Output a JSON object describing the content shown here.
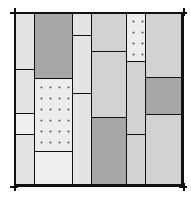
{
  "diagram": {
    "title": "",
    "colors": {
      "line": "#111111",
      "light": "#e4e4e4",
      "lighter": "#efefef",
      "mid": "#d2d2d2",
      "dark": "#a7a7a7",
      "stipple": "#ececec"
    },
    "tiles": [
      {
        "col": "A",
        "x": 14,
        "y": 12,
        "w": 20,
        "h": 57,
        "fill": "light"
      },
      {
        "col": "A",
        "x": 14,
        "y": 69,
        "w": 20,
        "h": 44,
        "fill": "light"
      },
      {
        "col": "A",
        "x": 14,
        "y": 113,
        "w": 20,
        "h": 21,
        "fill": "lighter"
      },
      {
        "col": "A",
        "x": 14,
        "y": 134,
        "w": 20,
        "h": 52,
        "fill": "light"
      },
      {
        "col": "B",
        "x": 34,
        "y": 12,
        "w": 38,
        "h": 66,
        "fill": "dark"
      },
      {
        "col": "B",
        "x": 34,
        "y": 78,
        "w": 38,
        "h": 73,
        "fill": "dotted"
      },
      {
        "col": "B",
        "x": 34,
        "y": 151,
        "w": 38,
        "h": 35,
        "fill": "lighter"
      },
      {
        "col": "C",
        "x": 72,
        "y": 12,
        "w": 19,
        "h": 23,
        "fill": "light"
      },
      {
        "col": "C",
        "x": 72,
        "y": 35,
        "w": 19,
        "h": 58,
        "fill": "light"
      },
      {
        "col": "C",
        "x": 72,
        "y": 93,
        "w": 19,
        "h": 93,
        "fill": "light"
      },
      {
        "col": "D",
        "x": 91,
        "y": 12,
        "w": 35,
        "h": 39,
        "fill": "mid"
      },
      {
        "col": "D",
        "x": 91,
        "y": 51,
        "w": 35,
        "h": 66,
        "fill": "mid"
      },
      {
        "col": "D",
        "x": 91,
        "y": 117,
        "w": 35,
        "h": 69,
        "fill": "dark"
      },
      {
        "col": "E",
        "x": 126,
        "y": 12,
        "w": 19,
        "h": 49,
        "fill": "dotted"
      },
      {
        "col": "E",
        "x": 126,
        "y": 61,
        "w": 19,
        "h": 73,
        "fill": "mid"
      },
      {
        "col": "E",
        "x": 126,
        "y": 134,
        "w": 19,
        "h": 52,
        "fill": "mid"
      },
      {
        "col": "F",
        "x": 145,
        "y": 12,
        "w": 38,
        "h": 65,
        "fill": "mid"
      },
      {
        "col": "F",
        "x": 145,
        "y": 77,
        "w": 38,
        "h": 37,
        "fill": "dark"
      },
      {
        "col": "F",
        "x": 145,
        "y": 114,
        "w": 38,
        "h": 72,
        "fill": "mid"
      }
    ]
  }
}
